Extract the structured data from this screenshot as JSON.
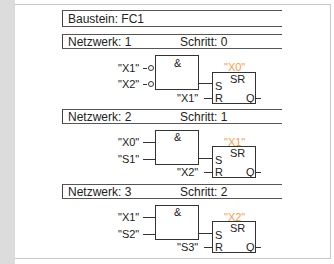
{
  "block": {
    "label": "Baustein: FC1"
  },
  "networks": [
    {
      "network_label": "Netzwerk: 1",
      "step_label": "Schritt: 0",
      "and_symbol": "&",
      "inputs": [
        "\"X1\"",
        "\"X2\""
      ],
      "inputs_negated": true,
      "sr_output": "\"X0\"",
      "sr_symbol": "SR",
      "reset_input": "\"X1\"",
      "pin_s": "S",
      "pin_r": "R",
      "pin_q": "Q"
    },
    {
      "network_label": "Netzwerk: 2",
      "step_label": "Schritt: 1",
      "and_symbol": "&",
      "inputs": [
        "\"X0\"",
        "\"S1\""
      ],
      "inputs_negated": false,
      "sr_output": "\"X1\"",
      "sr_symbol": "SR",
      "reset_input": "\"X2\"",
      "pin_s": "S",
      "pin_r": "R",
      "pin_q": "Q"
    },
    {
      "network_label": "Netzwerk: 3",
      "step_label": "Schritt: 2",
      "and_symbol": "&",
      "inputs": [
        "\"X1\"",
        "\"S2\""
      ],
      "inputs_negated": false,
      "sr_output": "\"X2\"",
      "sr_symbol": "SR",
      "reset_input": "\"S3\"",
      "pin_s": "S",
      "pin_r": "R",
      "pin_q": "Q"
    }
  ],
  "colors": {
    "output_label": "#f0a050",
    "line": "#333333"
  }
}
